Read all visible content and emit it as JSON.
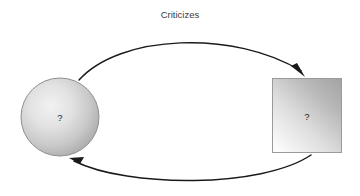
{
  "diagram": {
    "title": "Criticizes",
    "background_color": "#ffffff",
    "nodes": [
      {
        "id": "circle-node",
        "shape": "circle",
        "label": "?",
        "fill_light": "#efefef",
        "fill_dark": "#a9a9a9",
        "stroke": "#8f8f8f",
        "cx": 60,
        "cy": 117,
        "r": 39
      },
      {
        "id": "square-node",
        "shape": "rectangle",
        "label": "?",
        "fill_light": "#fbfbfb",
        "fill_dark": "#a6a6a6",
        "stroke": "#9a9a9a",
        "x": 272,
        "y": 78,
        "width": 70,
        "height": 75
      }
    ],
    "edges": [
      {
        "id": "edge-top",
        "from": "circle-node",
        "to": "square-node",
        "direction": "left-to-right",
        "label": "Criticizes",
        "color": "#1a1a1a"
      },
      {
        "id": "edge-bottom",
        "from": "square-node",
        "to": "circle-node",
        "direction": "right-to-left",
        "label": "",
        "color": "#1a1a1a"
      }
    ]
  }
}
